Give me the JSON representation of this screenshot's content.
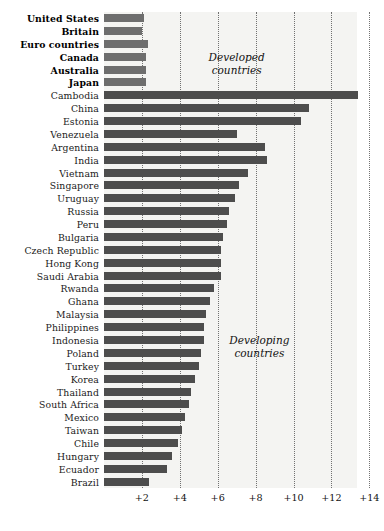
{
  "chart": {
    "type": "bar",
    "orientation": "horizontal",
    "background_color": "#f4f4f2",
    "bar_color": "#4d4d4d",
    "developed_bar_color": "#6e6e6e",
    "grid": true,
    "grid_style": "dotted-vertical"
  },
  "annotations": [
    {
      "id": "developed",
      "text": "Developed\ncountries",
      "x_value": 7.0,
      "row_index": 3
    },
    {
      "id": "developing",
      "text": "Developing\ncountries",
      "x_value": 8.2,
      "row_index": 25
    }
  ],
  "axis": {
    "tick_labels": [
      "+2",
      "+4",
      "+6",
      "+8",
      "+10",
      "+12",
      "+14"
    ],
    "tick_values": [
      2,
      4,
      6,
      8,
      10,
      12,
      14
    ],
    "xlim": [
      0,
      14.6
    ],
    "xlabel": "",
    "ylabel": ""
  },
  "chart_data": {
    "type": "bar",
    "orientation": "horizontal",
    "title": "",
    "subtitle": "",
    "xlabel": "",
    "ylabel": "",
    "xlim": [
      0,
      14.6
    ],
    "xticks": [
      2,
      4,
      6,
      8,
      10,
      12,
      14
    ],
    "xticklabels": [
      "+2",
      "+4",
      "+6",
      "+8",
      "+10",
      "+12",
      "+14"
    ],
    "grid": true,
    "legend": null,
    "groups": [
      {
        "name": "Developed countries",
        "categories": [
          "United States",
          "Britain",
          "Euro countries",
          "Canada",
          "Australia",
          "Japan"
        ]
      },
      {
        "name": "Developing countries",
        "categories": [
          "Cambodia",
          "China",
          "Estonia",
          "Venezuela",
          "Argentina",
          "India",
          "Vietnam",
          "Singapore",
          "Uruguay",
          "Russia",
          "Peru",
          "Bulgaria",
          "Czech Republic",
          "Hong Kong",
          "Saudi Arabia",
          "Rwanda",
          "Ghana",
          "Malaysia",
          "Philippines",
          "Indonesia",
          "Poland",
          "Turkey",
          "Korea",
          "Thailand",
          "South Africa",
          "Mexico",
          "Taiwan",
          "Chile",
          "Hungary",
          "Ecuador",
          "Brazil"
        ]
      }
    ],
    "categories": [
      "United States",
      "Britain",
      "Euro countries",
      "Canada",
      "Australia",
      "Japan",
      "Cambodia",
      "China",
      "Estonia",
      "Venezuela",
      "Argentina",
      "India",
      "Vietnam",
      "Singapore",
      "Uruguay",
      "Russia",
      "Peru",
      "Bulgaria",
      "Czech Republic",
      "Hong Kong",
      "Saudi Arabia",
      "Rwanda",
      "Ghana",
      "Malaysia",
      "Philippines",
      "Indonesia",
      "Poland",
      "Turkey",
      "Korea",
      "Thailand",
      "South Africa",
      "Mexico",
      "Taiwan",
      "Chile",
      "Hungary",
      "Ecuador",
      "Brazil"
    ],
    "values": [
      2.1,
      2.0,
      2.3,
      2.2,
      2.2,
      2.2,
      13.4,
      10.8,
      10.4,
      7.0,
      8.5,
      8.6,
      7.6,
      7.1,
      6.9,
      6.6,
      6.5,
      6.3,
      6.2,
      6.2,
      6.2,
      5.8,
      5.6,
      5.4,
      5.3,
      5.3,
      5.1,
      5.0,
      4.8,
      4.6,
      4.5,
      4.3,
      4.1,
      3.9,
      3.6,
      3.3,
      2.4
    ]
  },
  "rows": [
    {
      "label": "United States",
      "value": 2.1,
      "group": "developed"
    },
    {
      "label": "Britain",
      "value": 2.0,
      "group": "developed"
    },
    {
      "label": "Euro countries",
      "value": 2.3,
      "group": "developed"
    },
    {
      "label": "Canada",
      "value": 2.2,
      "group": "developed"
    },
    {
      "label": "Australia",
      "value": 2.2,
      "group": "developed"
    },
    {
      "label": "Japan",
      "value": 2.2,
      "group": "developed"
    },
    {
      "label": "Cambodia",
      "value": 13.4,
      "group": "developing"
    },
    {
      "label": "China",
      "value": 10.8,
      "group": "developing"
    },
    {
      "label": "Estonia",
      "value": 10.4,
      "group": "developing"
    },
    {
      "label": "Venezuela",
      "value": 7.0,
      "group": "developing"
    },
    {
      "label": "Argentina",
      "value": 8.5,
      "group": "developing"
    },
    {
      "label": "India",
      "value": 8.6,
      "group": "developing"
    },
    {
      "label": "Vietnam",
      "value": 7.6,
      "group": "developing"
    },
    {
      "label": "Singapore",
      "value": 7.1,
      "group": "developing"
    },
    {
      "label": "Uruguay",
      "value": 6.9,
      "group": "developing"
    },
    {
      "label": "Russia",
      "value": 6.6,
      "group": "developing"
    },
    {
      "label": "Peru",
      "value": 6.5,
      "group": "developing"
    },
    {
      "label": "Bulgaria",
      "value": 6.3,
      "group": "developing"
    },
    {
      "label": "Czech Republic",
      "value": 6.2,
      "group": "developing"
    },
    {
      "label": "Hong Kong",
      "value": 6.2,
      "group": "developing"
    },
    {
      "label": "Saudi Arabia",
      "value": 6.2,
      "group": "developing"
    },
    {
      "label": "Rwanda",
      "value": 5.8,
      "group": "developing"
    },
    {
      "label": "Ghana",
      "value": 5.6,
      "group": "developing"
    },
    {
      "label": "Malaysia",
      "value": 5.4,
      "group": "developing"
    },
    {
      "label": "Philippines",
      "value": 5.3,
      "group": "developing"
    },
    {
      "label": "Indonesia",
      "value": 5.3,
      "group": "developing"
    },
    {
      "label": "Poland",
      "value": 5.1,
      "group": "developing"
    },
    {
      "label": "Turkey",
      "value": 5.0,
      "group": "developing"
    },
    {
      "label": "Korea",
      "value": 4.8,
      "group": "developing"
    },
    {
      "label": "Thailand",
      "value": 4.6,
      "group": "developing"
    },
    {
      "label": "South Africa",
      "value": 4.5,
      "group": "developing"
    },
    {
      "label": "Mexico",
      "value": 4.3,
      "group": "developing"
    },
    {
      "label": "Taiwan",
      "value": 4.1,
      "group": "developing"
    },
    {
      "label": "Chile",
      "value": 3.9,
      "group": "developing"
    },
    {
      "label": "Hungary",
      "value": 3.6,
      "group": "developing"
    },
    {
      "label": "Ecuador",
      "value": 3.3,
      "group": "developing"
    },
    {
      "label": "Brazil",
      "value": 2.4,
      "group": "developing"
    }
  ]
}
